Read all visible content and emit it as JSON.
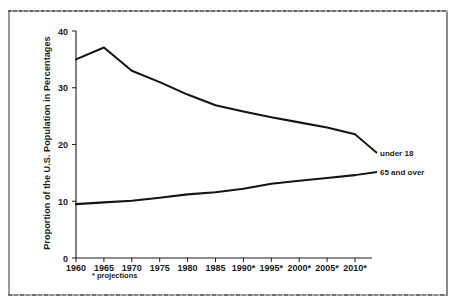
{
  "figure": {
    "footnote": "* projections",
    "ylabel": "Proportion of the U.S. Population in Percentages"
  },
  "chart_data": {
    "type": "line",
    "title": "",
    "xlabel": "",
    "ylabel": "Proportion of the U.S. Population in Percentages",
    "categories": [
      "1960",
      "1965",
      "1970",
      "1975",
      "1980",
      "1985",
      "1990*",
      "1995*",
      "2000*",
      "2005*",
      "2010*"
    ],
    "xtick_labels": [
      "1960",
      "1965",
      "1970",
      "1975",
      "1980",
      "1985",
      "1990*",
      "1995*",
      "2000*",
      "2005*",
      "2010*"
    ],
    "ytick_labels": [
      "0",
      "10",
      "20",
      "30",
      "40"
    ],
    "yticks": [
      0,
      10,
      20,
      30,
      40
    ],
    "ylim": [
      0,
      40
    ],
    "grid": false,
    "legend_position": "right-inline",
    "footnote": "* projections",
    "series": [
      {
        "name": "under 18",
        "label": "under 18",
        "values": [
          35.0,
          37.1,
          33.0,
          31.0,
          28.8,
          26.9,
          25.8,
          24.8,
          23.9,
          23.0,
          21.8
        ]
      },
      {
        "name": "65 and over",
        "label": "65 and over",
        "values": [
          9.5,
          9.8,
          10.1,
          10.6,
          11.2,
          11.6,
          12.2,
          13.1,
          13.6,
          14.1,
          14.6
        ]
      }
    ]
  }
}
